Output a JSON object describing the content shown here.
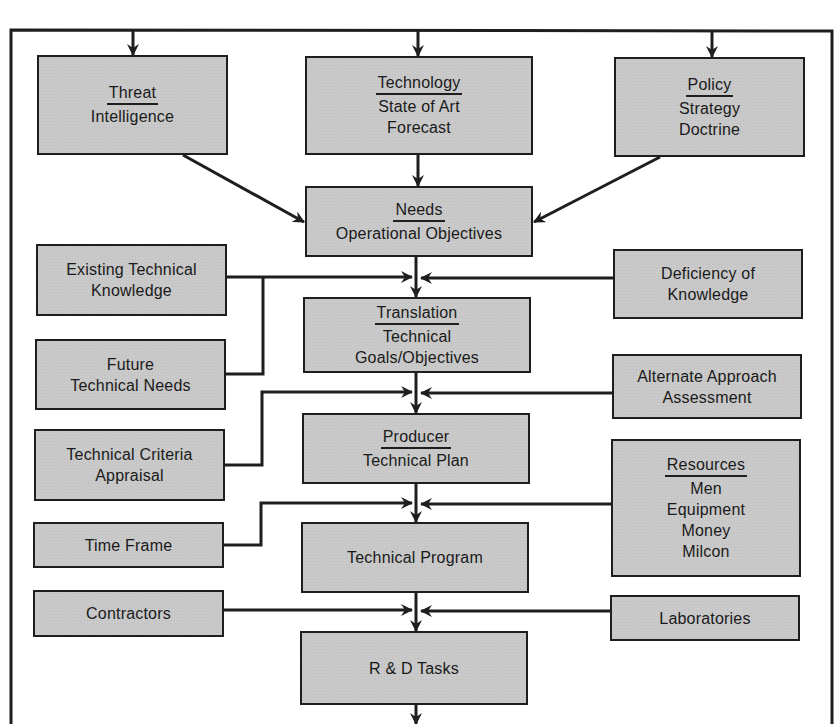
{
  "diagram": {
    "colors": {
      "box_fill": "#c9c9c9",
      "line": "#1e1e1e",
      "background": "#ffffff"
    },
    "top_row": {
      "threat": {
        "title": "Threat",
        "lines": [
          "Intelligence"
        ]
      },
      "technology": {
        "title": "Technology",
        "lines": [
          "State of Art",
          "Forecast"
        ]
      },
      "policy": {
        "title": "Policy",
        "lines": [
          "Strategy",
          "Doctrine"
        ]
      }
    },
    "center_column": {
      "needs": {
        "title": "Needs",
        "lines": [
          "Operational Objectives"
        ]
      },
      "translation": {
        "title": "Translation",
        "lines": [
          "Technical",
          "Goals/Objectives"
        ]
      },
      "producer": {
        "title": "Producer",
        "lines": [
          "Technical Plan"
        ]
      },
      "technical_program": {
        "lines": [
          "Technical Program"
        ]
      },
      "rd_tasks": {
        "lines": [
          "R & D Tasks"
        ]
      }
    },
    "left_inputs": {
      "existing_knowledge": {
        "lines": [
          "Existing Technical",
          "Knowledge"
        ]
      },
      "future_needs": {
        "lines": [
          "Future",
          "Technical Needs"
        ]
      },
      "criteria_appraisal": {
        "lines": [
          "Technical Criteria",
          "Appraisal"
        ]
      },
      "time_frame": {
        "lines": [
          "Time Frame"
        ]
      },
      "contractors": {
        "lines": [
          "Contractors"
        ]
      }
    },
    "right_inputs": {
      "deficiency": {
        "lines": [
          "Deficiency of",
          "Knowledge"
        ]
      },
      "alternate_approach": {
        "lines": [
          "Alternate Approach",
          "Assessment"
        ]
      },
      "resources": {
        "title": "Resources",
        "lines": [
          "Men",
          "Equipment",
          "Money",
          "Milcon"
        ]
      },
      "laboratories": {
        "lines": [
          "Laboratories"
        ]
      }
    }
  }
}
